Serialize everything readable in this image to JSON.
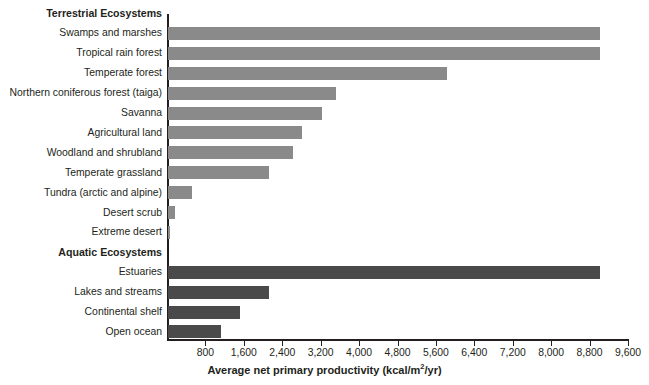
{
  "chart_data": {
    "type": "bar",
    "orientation": "horizontal",
    "title": "",
    "xlabel": "Average net primary productivity (kcal/m2/yr)",
    "xlabel_parts": {
      "main": "Average net primary productivity (kcal/m",
      "superscript": "2",
      "tail": "/yr)"
    },
    "ylabel": "",
    "xlim": [
      0,
      9600
    ],
    "xticks": [
      0,
      800,
      1600,
      2400,
      3200,
      4000,
      4800,
      5600,
      6400,
      7200,
      8000,
      8800,
      9600
    ],
    "xtick_labels": [
      "",
      "800",
      "1,600",
      "2,400",
      "3,200",
      "4,000",
      "4,800",
      "5,600",
      "6,400",
      "7,200",
      "8,000",
      "8,800",
      "9,600"
    ],
    "grid": false,
    "legend": "none",
    "groups": [
      {
        "name": "Terrestrial Ecosystems",
        "color": "#8a8a8a",
        "categories": [
          "Swamps and marshes",
          "Tropical rain forest",
          "Temperate forest",
          "Northern coniferous forest (taiga)",
          "Savanna",
          "Agricultural land",
          "Woodland and shrubland",
          "Temperate grassland",
          "Tundra (arctic and alpine)",
          "Desert scrub",
          "Extreme desert"
        ],
        "values": [
          9000,
          9000,
          5800,
          3500,
          3200,
          2800,
          2600,
          2100,
          500,
          150,
          50
        ]
      },
      {
        "name": "Aquatic Ecosystems",
        "color": "#4a4a4a",
        "categories": [
          "Estuaries",
          "Lakes and streams",
          "Continental shelf",
          "Open ocean"
        ],
        "values": [
          9000,
          2100,
          1500,
          1100
        ]
      }
    ]
  },
  "colors": {
    "terrestrial_bar": "#8a8a8a",
    "aquatic_bar": "#4a4a4a",
    "axis": "#231f20",
    "text": "#231f20",
    "background": "#ffffff"
  }
}
